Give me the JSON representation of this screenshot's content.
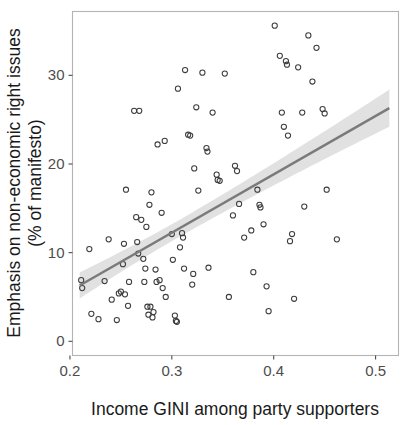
{
  "chart_data": {
    "type": "scatter",
    "title": "",
    "xlabel": "Income GINI among party supporters",
    "ylabel": "Emphasis on non-economic right issues\n(% of manifesto)",
    "ylabel_line1": "Emphasis on non-economic right issues",
    "ylabel_line2": "(% of manifesto)",
    "xlim": [
      0.2025,
      0.5225
    ],
    "ylim": [
      -1.6,
      37.2
    ],
    "xticks": [
      0.2,
      0.3,
      0.4,
      0.5
    ],
    "xtick_labels": [
      "0.2",
      "0.3",
      "0.4",
      "0.5"
    ],
    "yticks": [
      0,
      10,
      20,
      30
    ],
    "ytick_labels": [
      "0",
      "10",
      "20",
      "30"
    ],
    "grid": false,
    "legend": null,
    "marker": "open-circle",
    "point_color": "#3d3d3d",
    "line_color": "#7a7a7a",
    "band_color": "#dcdcdc",
    "panel_border_color": "#b3b3b3",
    "background": "#ffffff",
    "fit": {
      "type": "linear",
      "x_start": 0.2095,
      "y_start": 6.3,
      "x_end": 0.5135,
      "y_end": 26.3,
      "ci_half_width_start": 2.9,
      "ci_half_width_mid": 0.95,
      "ci_half_width_end": 2.1,
      "ci_mid_x": 0.305
    },
    "points": [
      [
        0.211,
        6.9
      ],
      [
        0.212,
        6.0
      ],
      [
        0.219,
        10.4
      ],
      [
        0.221,
        3.1
      ],
      [
        0.228,
        2.5
      ],
      [
        0.234,
        6.8
      ],
      [
        0.238,
        11.5
      ],
      [
        0.241,
        4.7
      ],
      [
        0.246,
        2.4
      ],
      [
        0.248,
        5.4
      ],
      [
        0.25,
        5.6
      ],
      [
        0.252,
        8.7
      ],
      [
        0.253,
        11.0
      ],
      [
        0.254,
        5.3
      ],
      [
        0.255,
        17.1
      ],
      [
        0.257,
        4.0
      ],
      [
        0.258,
        6.7
      ],
      [
        0.263,
        26.0
      ],
      [
        0.268,
        26.0
      ],
      [
        0.265,
        14.0
      ],
      [
        0.266,
        11.2
      ],
      [
        0.267,
        9.9
      ],
      [
        0.27,
        13.7
      ],
      [
        0.272,
        9.3
      ],
      [
        0.273,
        6.7
      ],
      [
        0.274,
        8.2
      ],
      [
        0.275,
        12.9
      ],
      [
        0.276,
        3.9
      ],
      [
        0.277,
        3.0
      ],
      [
        0.278,
        15.4
      ],
      [
        0.279,
        3.9
      ],
      [
        0.28,
        16.8
      ],
      [
        0.281,
        2.7
      ],
      [
        0.282,
        3.3
      ],
      [
        0.284,
        8.1
      ],
      [
        0.285,
        6.7
      ],
      [
        0.286,
        22.2
      ],
      [
        0.288,
        6.9
      ],
      [
        0.29,
        14.5
      ],
      [
        0.291,
        6.0
      ],
      [
        0.293,
        22.6
      ],
      [
        0.294,
        5.0
      ],
      [
        0.3,
        12.1
      ],
      [
        0.301,
        9.2
      ],
      [
        0.303,
        2.9
      ],
      [
        0.304,
        2.3
      ],
      [
        0.305,
        2.2
      ],
      [
        0.306,
        28.5
      ],
      [
        0.308,
        10.6
      ],
      [
        0.31,
        12.2
      ],
      [
        0.311,
        11.7
      ],
      [
        0.312,
        8.2
      ],
      [
        0.313,
        30.6
      ],
      [
        0.316,
        23.3
      ],
      [
        0.318,
        23.2
      ],
      [
        0.32,
        6.4
      ],
      [
        0.321,
        7.6
      ],
      [
        0.322,
        19.5
      ],
      [
        0.324,
        26.4
      ],
      [
        0.326,
        17.0
      ],
      [
        0.33,
        30.3
      ],
      [
        0.334,
        21.8
      ],
      [
        0.335,
        21.4
      ],
      [
        0.336,
        8.3
      ],
      [
        0.34,
        25.8
      ],
      [
        0.344,
        18.8
      ],
      [
        0.345,
        18.2
      ],
      [
        0.347,
        18.1
      ],
      [
        0.352,
        30.2
      ],
      [
        0.356,
        5.0
      ],
      [
        0.36,
        14.2
      ],
      [
        0.362,
        19.8
      ],
      [
        0.364,
        19.2
      ],
      [
        0.366,
        15.5
      ],
      [
        0.371,
        11.7
      ],
      [
        0.378,
        12.5
      ],
      [
        0.38,
        7.8
      ],
      [
        0.384,
        17.1
      ],
      [
        0.386,
        15.4
      ],
      [
        0.387,
        15.1
      ],
      [
        0.39,
        13.2
      ],
      [
        0.393,
        6.2
      ],
      [
        0.395,
        3.4
      ],
      [
        0.401,
        35.6
      ],
      [
        0.406,
        32.2
      ],
      [
        0.408,
        25.8
      ],
      [
        0.41,
        24.2
      ],
      [
        0.412,
        31.6
      ],
      [
        0.413,
        31.2
      ],
      [
        0.414,
        23.2
      ],
      [
        0.416,
        11.3
      ],
      [
        0.418,
        12.1
      ],
      [
        0.42,
        4.8
      ],
      [
        0.424,
        30.9
      ],
      [
        0.428,
        25.8
      ],
      [
        0.43,
        15.2
      ],
      [
        0.434,
        34.5
      ],
      [
        0.438,
        29.3
      ],
      [
        0.442,
        33.1
      ],
      [
        0.448,
        26.2
      ],
      [
        0.45,
        25.7
      ],
      [
        0.452,
        17.1
      ],
      [
        0.462,
        11.5
      ]
    ],
    "n_points": 103,
    "correlation_direction": "positive"
  },
  "figure": {
    "width": 415,
    "height": 425
  }
}
